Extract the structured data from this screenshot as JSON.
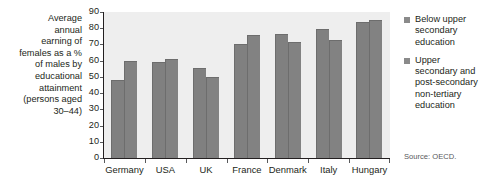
{
  "caption": {
    "lines": [
      "Average",
      "annual",
      "earning of",
      "females as a %",
      "of males by",
      "educational",
      "attainment",
      "(persons aged",
      "30–44)"
    ]
  },
  "legend": {
    "entries": [
      {
        "label": "Below upper secondary education",
        "color": "#8a8a8a"
      },
      {
        "label": "Upper secondary and post-secondary non-tertiary education",
        "color": "#8a8a8a"
      }
    ]
  },
  "source": "Source: OECD.",
  "chart_data": {
    "type": "bar",
    "title": "",
    "subtitle": "",
    "xlabel": "",
    "ylabel": "Average annual earning of females as a % of males by educational attainment (persons aged 30–44)",
    "ylim": [
      0,
      90
    ],
    "yticks": [
      0,
      10,
      20,
      30,
      40,
      50,
      60,
      70,
      80,
      90
    ],
    "ytick_labels": [
      "0",
      "10",
      "20",
      "30",
      "40",
      "50",
      "60",
      "70",
      "80",
      "90"
    ],
    "grid": false,
    "legend_position": "right",
    "categories": [
      "Germany",
      "USA",
      "UK",
      "France",
      "Denmark",
      "Italy",
      "Hungary"
    ],
    "series": [
      {
        "name": "Below upper secondary education",
        "color": "#808080",
        "values": [
          48,
          59,
          55.5,
          70.5,
          76.5,
          79.5,
          84
        ]
      },
      {
        "name": "Upper secondary and post-secondary non-tertiary education",
        "color": "#828282",
        "values": [
          60,
          61,
          50,
          76,
          71.5,
          73,
          85
        ]
      }
    ],
    "annotations": [
      "Source: OECD."
    ]
  }
}
